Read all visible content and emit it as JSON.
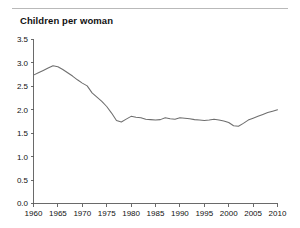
{
  "figure": {
    "title": "Children per woman",
    "background_color": "#ffffff",
    "rule_color": "#b9b9b9",
    "axis_color": "#5a5a5a",
    "line_color": "#6e6e6e"
  },
  "chart_data": {
    "type": "line",
    "title": "Children per woman",
    "xlabel": "",
    "ylabel": "",
    "xlim": [
      1960,
      2010
    ],
    "ylim": [
      0.0,
      3.5
    ],
    "grid": false,
    "legend": null,
    "xticks": [
      1960,
      1965,
      1970,
      1975,
      1980,
      1985,
      1990,
      1995,
      2000,
      2005,
      2010
    ],
    "xtick_labels": [
      "1960",
      "1965",
      "1970",
      "1975",
      "1980",
      "1985",
      "1990",
      "1995",
      "2000",
      "2005",
      "2010"
    ],
    "yticks": [
      0.0,
      0.5,
      1.0,
      1.5,
      2.0,
      2.5,
      3.0,
      3.5
    ],
    "ytick_labels": [
      "0.0",
      "0.5",
      "1.0",
      "1.5",
      "2.0",
      "2.5",
      "3.0",
      "3.5"
    ],
    "series": [
      {
        "name": "Children per woman",
        "color": "#6e6e6e",
        "x": [
          1960,
          1961,
          1962,
          1963,
          1964,
          1965,
          1966,
          1967,
          1968,
          1969,
          1970,
          1971,
          1972,
          1973,
          1974,
          1975,
          1976,
          1977,
          1978,
          1979,
          1980,
          1981,
          1982,
          1983,
          1984,
          1985,
          1986,
          1987,
          1988,
          1989,
          1990,
          1991,
          1992,
          1993,
          1994,
          1995,
          1996,
          1997,
          1998,
          1999,
          2000,
          2001,
          2002,
          2003,
          2004,
          2005,
          2006,
          2007,
          2008,
          2009,
          2010
        ],
        "values": [
          2.74,
          2.79,
          2.84,
          2.89,
          2.94,
          2.92,
          2.86,
          2.79,
          2.72,
          2.64,
          2.57,
          2.51,
          2.36,
          2.27,
          2.18,
          2.07,
          1.93,
          1.77,
          1.74,
          1.8,
          1.86,
          1.84,
          1.83,
          1.8,
          1.79,
          1.78,
          1.79,
          1.83,
          1.81,
          1.8,
          1.83,
          1.82,
          1.81,
          1.79,
          1.78,
          1.77,
          1.78,
          1.8,
          1.78,
          1.76,
          1.73,
          1.66,
          1.65,
          1.71,
          1.78,
          1.82,
          1.86,
          1.9,
          1.94,
          1.97,
          2.0
        ]
      }
    ]
  }
}
